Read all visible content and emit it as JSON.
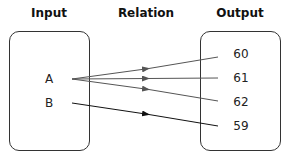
{
  "headers": {
    "input": "Input",
    "relation": "Relation",
    "output": "Output"
  },
  "input_set": [
    "A",
    "B"
  ],
  "output_set": [
    "60",
    "61",
    "62",
    "59"
  ],
  "mappings": [
    {
      "from": "A",
      "to": "60",
      "color": "#555555"
    },
    {
      "from": "A",
      "to": "61",
      "color": "#555555"
    },
    {
      "from": "A",
      "to": "62",
      "color": "#555555"
    },
    {
      "from": "B",
      "to": "59",
      "color": "#111111"
    }
  ]
}
